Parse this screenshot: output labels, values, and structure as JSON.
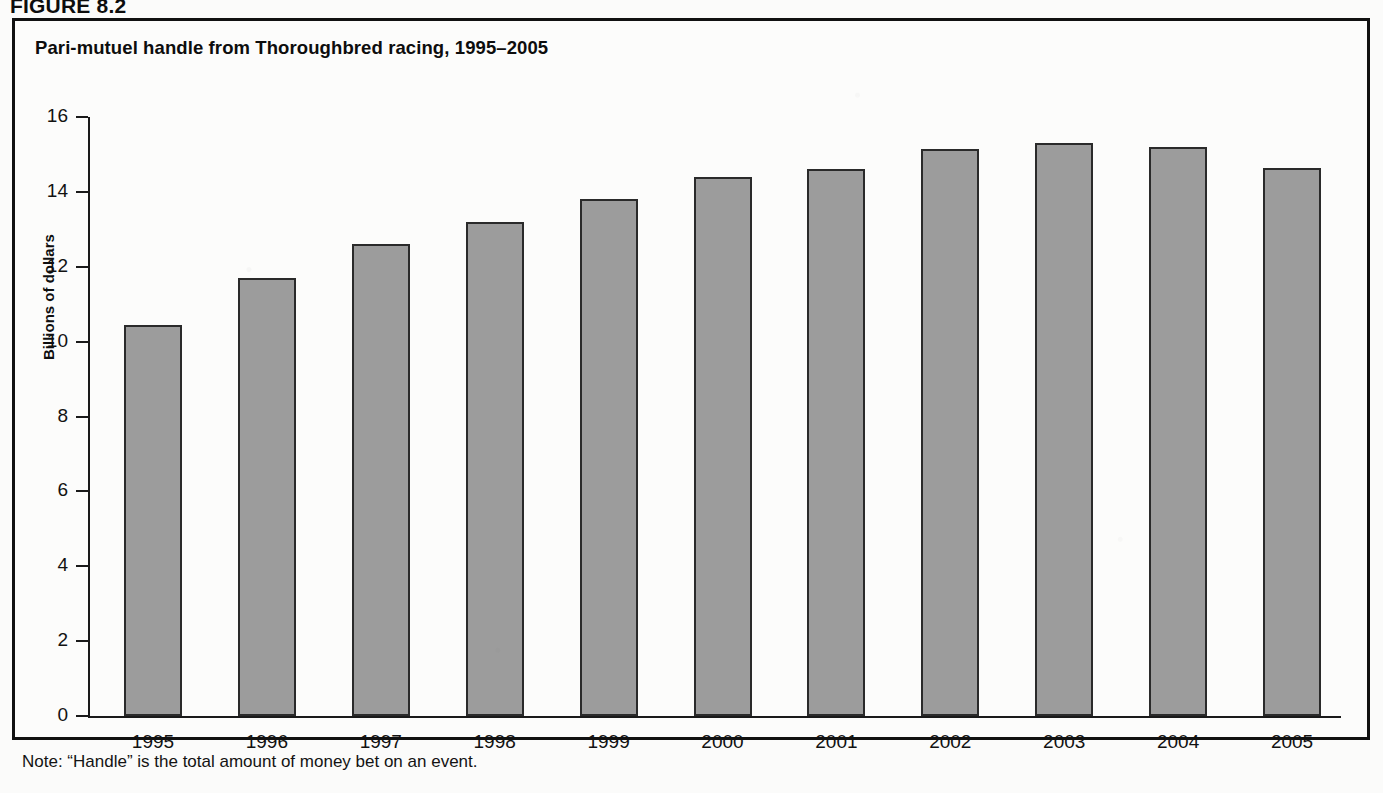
{
  "figure": {
    "label": "FIGURE 8.2",
    "title": "Pari-mutuel handle from Thoroughbred racing, 1995–2005",
    "note": "Note: “Handle” is the total amount of money bet on an event."
  },
  "colors": {
    "bar_fill": "#9c9c9c",
    "bar_stroke": "#2a2a2a",
    "axis": "#1a1a1a",
    "frame": "#111111",
    "text": "#111111",
    "page_background": "#fbfbfa"
  },
  "chart_data": {
    "type": "bar",
    "title": "Pari-mutuel handle from Thoroughbred racing, 1995–2005",
    "xlabel": "",
    "ylabel": "Billions of dollars",
    "categories": [
      "1995",
      "1996",
      "1997",
      "1998",
      "1999",
      "2000",
      "2001",
      "2002",
      "2003",
      "2004",
      "2005"
    ],
    "values": [
      10.45,
      11.7,
      12.6,
      13.2,
      13.8,
      14.4,
      14.6,
      15.15,
      15.3,
      15.2,
      14.65
    ],
    "ylim": [
      0,
      16
    ],
    "yticks": [
      0,
      2,
      4,
      6,
      8,
      10,
      12,
      14,
      16
    ],
    "ytick_labels": [
      "0",
      "2",
      "4",
      "6",
      "8",
      "10",
      "12",
      "14",
      "16"
    ],
    "grid": false,
    "legend": null,
    "annotations": [
      "Note: “Handle” is the total amount of money bet on an event."
    ]
  }
}
